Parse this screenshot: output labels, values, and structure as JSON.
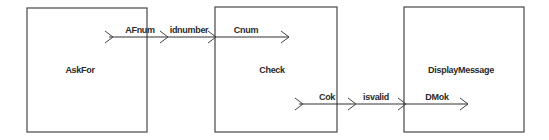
{
  "diagram": {
    "type": "block-diagram",
    "blocks": [
      {
        "id": "askfor",
        "title": "AskFor",
        "x": 27,
        "y": 8,
        "w": 120,
        "h": 124
      },
      {
        "id": "check",
        "title": "Check",
        "x": 215,
        "y": 7,
        "w": 122,
        "h": 125
      },
      {
        "id": "displaymessage",
        "title": "DisplayMessage",
        "x": 404,
        "y": 7,
        "w": 120,
        "h": 125
      }
    ],
    "connections": [
      {
        "id": "top-flow",
        "y": 37,
        "x_start": 105,
        "x_end": 289,
        "ports": [
          {
            "label": "AFnum",
            "role": "output-port",
            "block": "AskFor",
            "chevron_x": 105,
            "label_x": 140
          },
          {
            "label": "idnumber",
            "role": "signal",
            "block": "",
            "chevron_x": 160,
            "label_x": 185
          },
          {
            "label": "",
            "role": "input-entry",
            "block": "Check",
            "chevron_x": 208,
            "label_x": 0
          },
          {
            "label": "Cnum",
            "role": "input-port",
            "block": "Check",
            "chevron_x": 281,
            "label_x": 246
          }
        ]
      },
      {
        "id": "bottom-flow",
        "y": 104,
        "x_start": 295,
        "x_end": 468,
        "ports": [
          {
            "label": "Cok",
            "role": "output-port",
            "block": "Check",
            "chevron_x": 295,
            "label_x": 327
          },
          {
            "label": "isvalid",
            "role": "signal",
            "block": "",
            "chevron_x": 348,
            "label_x": 374
          },
          {
            "label": "",
            "role": "input-entry",
            "block": "DisplayMessage",
            "chevron_x": 398,
            "label_x": 0
          },
          {
            "label": "DMok",
            "role": "input-port",
            "block": "DisplayMessage",
            "chevron_x": 460,
            "label_x": 437
          }
        ]
      }
    ],
    "colors": {
      "background": "#ffffff",
      "box_stroke": "#555555",
      "wire": "#333333",
      "text": "#2a2a2a"
    }
  }
}
